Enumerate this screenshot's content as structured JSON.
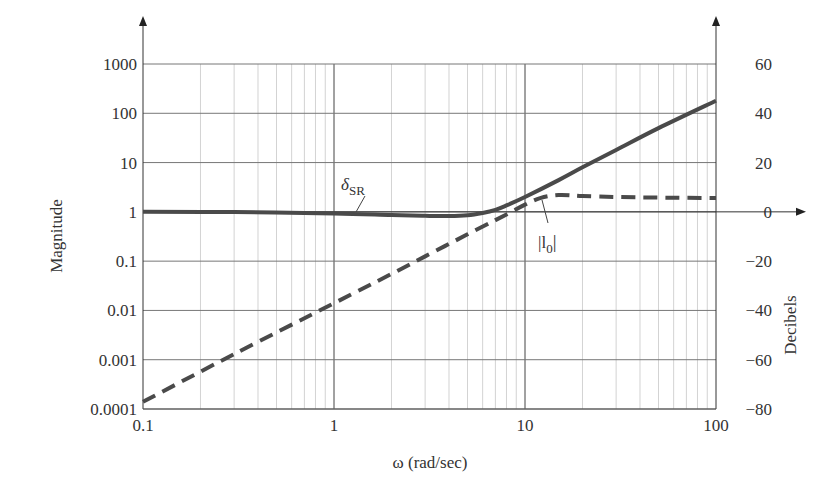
{
  "chart_data": {
    "type": "line",
    "title": "",
    "xlabel": "ω (rad/sec)",
    "ylabel": "Magnitude",
    "y2label": "Decibels",
    "xscale": "log",
    "yscale": "log",
    "xlim": [
      0.1,
      100
    ],
    "ylim": [
      0.0001,
      1000
    ],
    "y2lim": [
      -80,
      60
    ],
    "grid": true,
    "x_ticks": [
      "0.1",
      "1",
      "10",
      "100"
    ],
    "y_ticks": [
      "0.0001",
      "0.001",
      "0.01",
      "0.1",
      "1",
      "10",
      "100",
      "1000"
    ],
    "y2_ticks": [
      "−80",
      "−60",
      "−40",
      "−20",
      "0",
      "20",
      "40",
      "60"
    ],
    "legend_position": "inline annotations",
    "series": [
      {
        "name": "δSR",
        "label_main": "δ",
        "label_sub": "SR",
        "style": "solid",
        "x": [
          0.1,
          0.3,
          1,
          2,
          3,
          4,
          5,
          6,
          7,
          8,
          10,
          15,
          20,
          30,
          50,
          100
        ],
        "values": [
          1.0,
          0.99,
          0.93,
          0.86,
          0.83,
          0.82,
          0.85,
          0.95,
          1.1,
          1.35,
          2.0,
          4.4,
          8.0,
          18,
          50,
          180
        ]
      },
      {
        "name": "|l0|",
        "label_main": "|l",
        "label_sub": "0",
        "label_end": "|",
        "style": "dashed",
        "x": [
          0.1,
          0.3,
          1,
          2,
          3,
          5,
          7,
          8.5,
          10,
          12,
          15,
          20,
          30,
          50,
          100
        ],
        "values": [
          0.00014,
          0.0013,
          0.014,
          0.055,
          0.125,
          0.35,
          0.68,
          1.0,
          1.4,
          1.9,
          2.2,
          2.1,
          2.0,
          1.95,
          1.9
        ]
      }
    ]
  }
}
